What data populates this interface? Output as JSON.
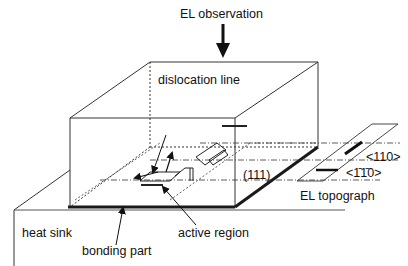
{
  "diagram": {
    "labels": {
      "observation": "EL observation",
      "dislocation_line": "dislocation line",
      "plane": "(111)",
      "dir_110": "<110>",
      "dir_1bar10": "<1̄1̄0>",
      "el_topograph": "EL topograph",
      "heat_sink": "heat sink",
      "bonding_part": "bonding part",
      "active_region": "active region"
    },
    "colors": {
      "line": "#222222",
      "bond": "#1a1a1a",
      "background": "#ffffff"
    }
  }
}
